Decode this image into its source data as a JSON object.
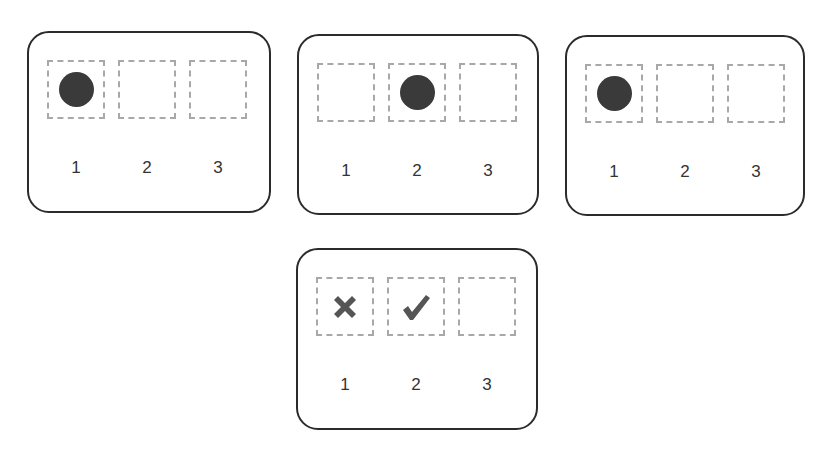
{
  "panels": [
    {
      "id": "panel-1",
      "slots": [
        {
          "label": "1",
          "content": "dot"
        },
        {
          "label": "2",
          "content": "empty"
        },
        {
          "label": "3",
          "content": "empty"
        }
      ]
    },
    {
      "id": "panel-2",
      "slots": [
        {
          "label": "1",
          "content": "empty"
        },
        {
          "label": "2",
          "content": "dot"
        },
        {
          "label": "3",
          "content": "empty"
        }
      ]
    },
    {
      "id": "panel-3",
      "slots": [
        {
          "label": "1",
          "content": "dot"
        },
        {
          "label": "2",
          "content": "empty"
        },
        {
          "label": "3",
          "content": "empty"
        }
      ]
    },
    {
      "id": "panel-4",
      "slots": [
        {
          "label": "1",
          "content": "cross-icon"
        },
        {
          "label": "2",
          "content": "check-icon"
        },
        {
          "label": "3",
          "content": "empty"
        }
      ]
    }
  ],
  "colors": {
    "panel_border": "#2b2b2b",
    "slot_border": "#a8a8a8",
    "dot": "#3a3a3a",
    "mark": "#555555"
  }
}
